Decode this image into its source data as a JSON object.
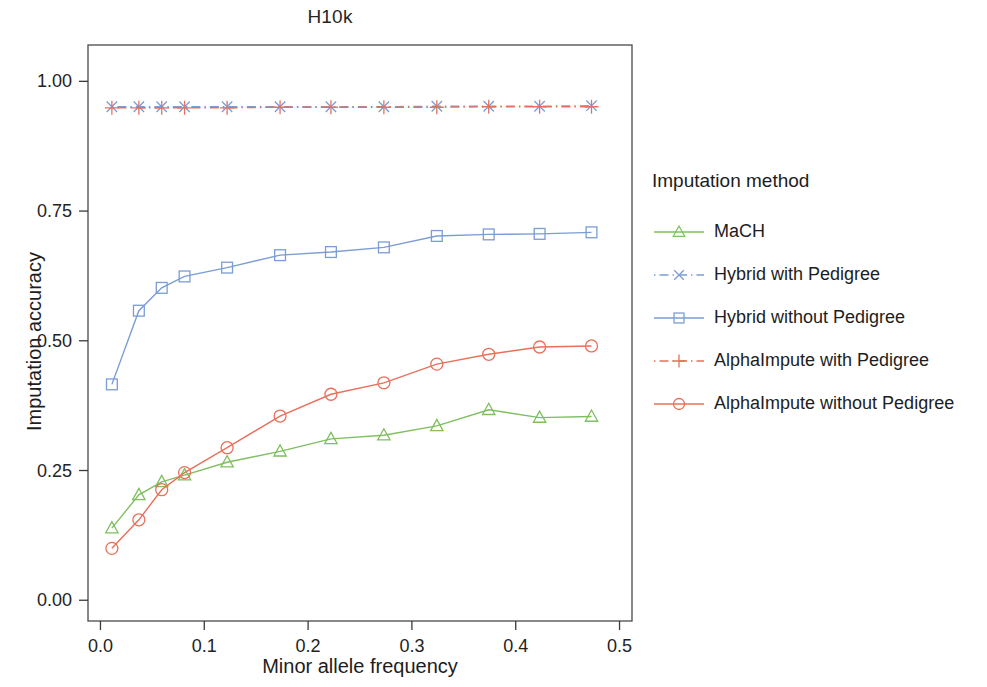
{
  "chart_data": {
    "type": "line",
    "title": "H10k",
    "xlabel": "Minor allele frequency",
    "ylabel": "Imputation accuracy",
    "xlim": [
      -0.012,
      0.512
    ],
    "ylim": [
      -0.04,
      1.07
    ],
    "xticks": [
      0.0,
      0.1,
      0.2,
      0.3,
      0.4,
      0.5
    ],
    "xtick_labels": [
      "0.0",
      "0.1",
      "0.2",
      "0.3",
      "0.4",
      "0.5"
    ],
    "yticks": [
      0.0,
      0.25,
      0.5,
      0.75,
      1.0
    ],
    "ytick_labels": [
      "0.00",
      "0.25",
      "0.50",
      "0.75",
      "1.00"
    ],
    "grid": false,
    "legend_position": "right",
    "legend_title": "Imputation method",
    "x": [
      0.011,
      0.037,
      0.059,
      0.081,
      0.122,
      0.173,
      0.222,
      0.273,
      0.324,
      0.374,
      0.423,
      0.473
    ],
    "series": [
      {
        "name": "MaCH",
        "color": "#7FBF5F",
        "marker": "triangle",
        "linestyle": "solid",
        "values": [
          0.139,
          0.203,
          0.228,
          0.241,
          0.266,
          0.287,
          0.311,
          0.318,
          0.336,
          0.367,
          0.352,
          0.354
        ]
      },
      {
        "name": "Hybrid with Pedigree",
        "color": "#7A9DD4",
        "marker": "cross-x",
        "linestyle": "dotdash",
        "values": [
          0.951,
          0.951,
          0.951,
          0.951,
          0.951,
          0.951,
          0.951,
          0.951,
          0.952,
          0.952,
          0.952,
          0.953
        ]
      },
      {
        "name": "Hybrid without Pedigree",
        "color": "#7A9DD4",
        "marker": "square",
        "linestyle": "solid",
        "values": [
          0.416,
          0.558,
          0.602,
          0.624,
          0.641,
          0.665,
          0.671,
          0.68,
          0.702,
          0.705,
          0.706,
          0.709
        ]
      },
      {
        "name": "AlphaImpute with Pedigree",
        "color": "#E8705A",
        "marker": "plus",
        "linestyle": "dotdash",
        "values": [
          0.949,
          0.949,
          0.949,
          0.949,
          0.949,
          0.95,
          0.95,
          0.95,
          0.95,
          0.951,
          0.951,
          0.951
        ]
      },
      {
        "name": "AlphaImpute without Pedigree",
        "color": "#E8705A",
        "marker": "circle",
        "linestyle": "solid",
        "values": [
          0.1,
          0.155,
          0.213,
          0.246,
          0.294,
          0.355,
          0.397,
          0.419,
          0.455,
          0.474,
          0.488,
          0.49
        ]
      }
    ]
  },
  "legend": {
    "title": "Imputation method",
    "items": [
      {
        "label": "MaCH"
      },
      {
        "label": "Hybrid with Pedigree"
      },
      {
        "label": "Hybrid without Pedigree"
      },
      {
        "label": "AlphaImpute with Pedigree"
      },
      {
        "label": "AlphaImpute without Pedigree"
      }
    ]
  },
  "axes": {
    "title": "H10k",
    "x_title": "Minor allele frequency",
    "y_title": "Imputation accuracy"
  }
}
